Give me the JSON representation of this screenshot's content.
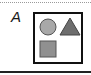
{
  "panel": {
    "label": "A",
    "shapes": [
      {
        "type": "circle",
        "fill": "#a8a8a8",
        "stroke": "#555555"
      },
      {
        "type": "triangle",
        "fill": "#6e6e6e",
        "stroke": "#444444"
      },
      {
        "type": "square",
        "fill": "#909090",
        "stroke": "#555555"
      }
    ]
  }
}
